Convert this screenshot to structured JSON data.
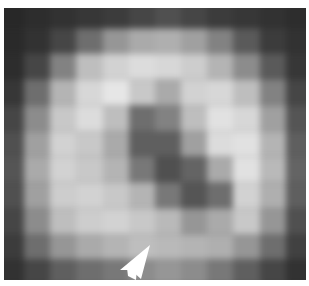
{
  "image": {
    "description": "Grayscale pixelated microscopy image of a ring/donut-shaped object with a darker curved indentation in the center, white arrowhead pointing at the lower edge",
    "colors": {
      "background_dark": "#3a3a3a",
      "ring_light": "#e6e6e6",
      "center_dark": "#555555",
      "arrow": "#ffffff"
    },
    "arrow": {
      "x": 128,
      "y": 270,
      "direction": "up-right"
    },
    "grid": {
      "cols": 12,
      "rows": 11,
      "values": [
        [
          40,
          45,
          50,
          55,
          60,
          70,
          80,
          70,
          60,
          55,
          50,
          45
        ],
        [
          42,
          50,
          70,
          110,
          150,
          170,
          175,
          160,
          130,
          90,
          60,
          50
        ],
        [
          45,
          70,
          130,
          190,
          210,
          220,
          215,
          205,
          180,
          140,
          90,
          55
        ],
        [
          55,
          110,
          180,
          215,
          230,
          200,
          170,
          210,
          215,
          190,
          130,
          70
        ],
        [
          70,
          140,
          200,
          220,
          190,
          110,
          130,
          190,
          225,
          215,
          160,
          85
        ],
        [
          80,
          160,
          210,
          200,
          170,
          95,
          95,
          160,
          220,
          225,
          180,
          95
        ],
        [
          85,
          170,
          210,
          200,
          180,
          120,
          80,
          100,
          170,
          225,
          185,
          100
        ],
        [
          80,
          160,
          205,
          210,
          200,
          180,
          120,
          85,
          110,
          210,
          175,
          95
        ],
        [
          70,
          140,
          190,
          205,
          210,
          200,
          185,
          150,
          170,
          200,
          150,
          80
        ],
        [
          60,
          110,
          150,
          170,
          180,
          190,
          185,
          180,
          175,
          150,
          110,
          65
        ],
        [
          50,
          70,
          95,
          110,
          120,
          140,
          150,
          140,
          120,
          95,
          70,
          50
        ]
      ]
    }
  }
}
